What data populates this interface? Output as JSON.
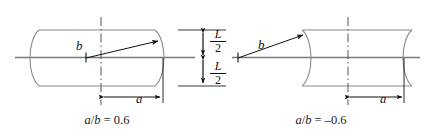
{
  "figure": {
    "name": "barrel-and-hourglass-curvature-diagram",
    "axis_color": "#7a7a7a",
    "outline_color": "#8a8a8a",
    "annotation_color": "#111111",
    "background": "#ffffff"
  },
  "left_panel": {
    "name": "positive-curvature-panel",
    "shape": "barrel",
    "caption": "a/b = 0.6",
    "caption_parts": {
      "a": "a",
      "slash": "/",
      "b": "b",
      "equals": " = ",
      "value": "0.6"
    },
    "radius_label": "b",
    "dimension_label": "a",
    "centerline": "dash-dot-vertical"
  },
  "right_panel": {
    "name": "negative-curvature-panel",
    "shape": "hourglass",
    "caption": "a/b = –0.6",
    "caption_parts": {
      "a": "a",
      "slash": "/",
      "b": "b",
      "equals": " = ",
      "value": "–0.6"
    },
    "radius_label": "b",
    "dimension_label": "a",
    "centerline": "dash-dot-vertical"
  },
  "center_dimension": {
    "name": "half-length-dimension",
    "upper": {
      "numerator": "L",
      "denominator": "2"
    },
    "lower": {
      "numerator": "L",
      "denominator": "2"
    },
    "total_symbol": "L",
    "description": "L/2 above axis and L/2 below axis"
  }
}
